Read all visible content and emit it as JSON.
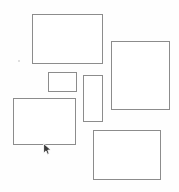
{
  "canvas": {
    "title": "Rectangles Canvas",
    "width": 179,
    "height": 192,
    "background_color": "#fefefe",
    "stroke_color": "#8a8a8a",
    "fill_color": "#ffffff"
  },
  "shapes": [
    {
      "id": "rect-top-left",
      "label": "Top Left Rectangle",
      "x": 32,
      "y": 14,
      "width": 71,
      "height": 50,
      "stroke": "#8c8c8c",
      "stroke_width": 1,
      "fill": "#ffffff"
    },
    {
      "id": "rect-right-large",
      "label": "Right Large Rectangle",
      "x": 111,
      "y": 41,
      "width": 59,
      "height": 69,
      "stroke": "#8c8c8c",
      "stroke_width": 1,
      "fill": "#ffffff"
    },
    {
      "id": "rect-small-middle",
      "label": "Small Middle Rectangle",
      "x": 48,
      "y": 72,
      "width": 29,
      "height": 20,
      "stroke": "#8c8c8c",
      "stroke_width": 1,
      "fill": "#ffffff"
    },
    {
      "id": "rect-vertical-middle",
      "label": "Vertical Middle Rectangle",
      "x": 83,
      "y": 75,
      "width": 20,
      "height": 47,
      "stroke": "#8c8c8c",
      "stroke_width": 1,
      "fill": "#ffffff"
    },
    {
      "id": "rect-bottom-left",
      "label": "Bottom Left Rectangle",
      "x": 13,
      "y": 98,
      "width": 63,
      "height": 47,
      "stroke": "#8c8c8c",
      "stroke_width": 1,
      "fill": "#ffffff"
    },
    {
      "id": "rect-bottom-right",
      "label": "Bottom Right Rectangle",
      "x": 93,
      "y": 130,
      "width": 68,
      "height": 50,
      "stroke": "#8c8c8c",
      "stroke_width": 1,
      "fill": "#ffffff"
    }
  ],
  "marks": [
    {
      "id": "speck-left",
      "label": "Speck",
      "x": 18,
      "y": 60,
      "size": 2,
      "color": "#d5d5d5"
    }
  ],
  "cursor": {
    "label": "Mouse Pointer",
    "x": 43,
    "y": 143,
    "width": 9,
    "height": 12,
    "fill": "#3a3a3a",
    "outline": "#ffffff"
  }
}
